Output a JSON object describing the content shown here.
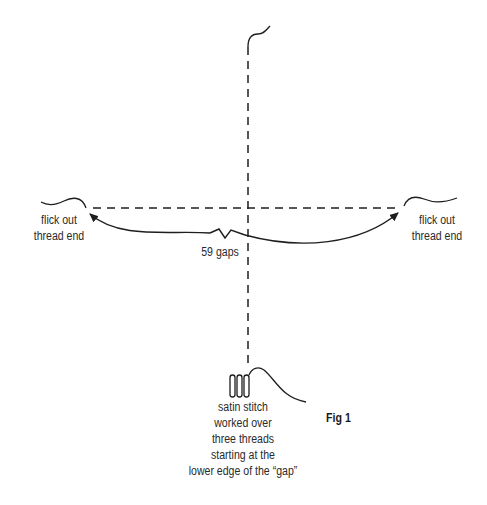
{
  "figure": {
    "caption": "Fig 1",
    "labels": {
      "left_end": [
        "flick out",
        "thread end"
      ],
      "right_end": [
        "flick out",
        "thread end"
      ],
      "gap_count": "59 gaps",
      "satin_note": [
        "satin stitch",
        "worked over",
        "three threads",
        "starting at the",
        "lower edge of the “gap”"
      ]
    },
    "elements": {
      "vertical_thread": "dashed",
      "horizontal_thread": "dashed",
      "arc": "double-headed arrow with zigzag break",
      "satin_stitch_loops": 3
    },
    "colors": {
      "line": "#1e1e1e",
      "background": "#ffffff"
    }
  }
}
